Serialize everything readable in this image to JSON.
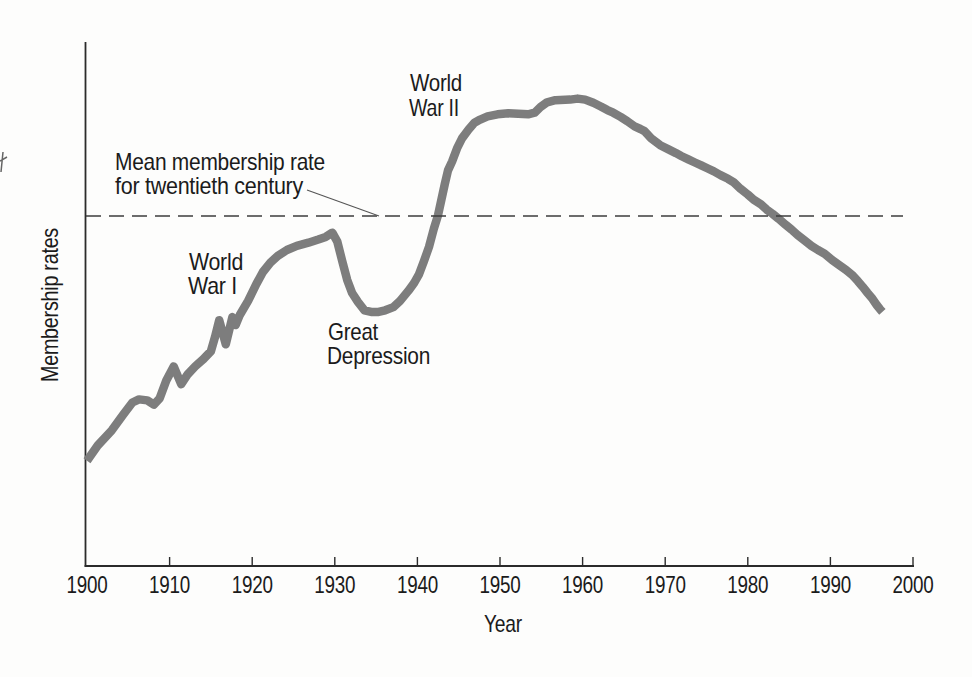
{
  "colors": {
    "background": "#fdfdfc",
    "ink": "#1b1b1b",
    "axis": "#2b2b2b",
    "curve": "#7d7d7d",
    "dashed_line": "#3d3d3d"
  },
  "chart_data": {
    "type": "line",
    "title": "",
    "xlabel": "Year",
    "ylabel": "Membership rates",
    "x_ticks": [
      1900,
      1910,
      1920,
      1930,
      1940,
      1950,
      1960,
      1970,
      1980,
      1990,
      2000
    ],
    "xlim": [
      1900,
      2000
    ],
    "ylim": [
      0,
      100
    ],
    "y_unit": "relative scale (no numeric y-axis labels shown)",
    "grid": false,
    "legend": false,
    "mean_line": {
      "style": "dashed",
      "value": 66.8,
      "label_line1": "Mean membership rate",
      "label_line2": "for twentieth century"
    },
    "annotations": {
      "world_war_1": {
        "line1": "World",
        "line2": "War I"
      },
      "world_war_2": {
        "line1": "World",
        "line2": "War II"
      },
      "great_depression": {
        "line1": "Great",
        "line2": "Depression"
      }
    },
    "series": [
      {
        "name": "Membership rates",
        "color": "#7d7d7d",
        "points": [
          [
            1900,
            20.1
          ],
          [
            1901.3,
            23
          ],
          [
            1903,
            25.9
          ],
          [
            1904.4,
            28.9
          ],
          [
            1905.5,
            31.2
          ],
          [
            1906.3,
            31.8
          ],
          [
            1907.3,
            31.6
          ],
          [
            1908.1,
            30.8
          ],
          [
            1908.8,
            32
          ],
          [
            1909.6,
            35.4
          ],
          [
            1910.5,
            38.1
          ],
          [
            1911,
            36.2
          ],
          [
            1911.4,
            34.7
          ],
          [
            1912.2,
            36.6
          ],
          [
            1913.1,
            38.1
          ],
          [
            1914.1,
            39.5
          ],
          [
            1915,
            41
          ],
          [
            1915.5,
            43.7
          ],
          [
            1916,
            46.9
          ],
          [
            1916.8,
            42.3
          ],
          [
            1917.6,
            47.5
          ],
          [
            1918,
            46
          ],
          [
            1918.5,
            47.9
          ],
          [
            1919.5,
            50.6
          ],
          [
            1920.5,
            53.8
          ],
          [
            1921.3,
            56.1
          ],
          [
            1922.2,
            57.9
          ],
          [
            1923.1,
            59.2
          ],
          [
            1924.2,
            60.3
          ],
          [
            1925.4,
            61.1
          ],
          [
            1926.8,
            61.7
          ],
          [
            1928,
            62.3
          ],
          [
            1928.9,
            62.8
          ],
          [
            1929.7,
            63.6
          ],
          [
            1930.3,
            61.9
          ],
          [
            1930.9,
            58.2
          ],
          [
            1931.5,
            54.6
          ],
          [
            1932.1,
            52.1
          ],
          [
            1932.8,
            50.4
          ],
          [
            1933.6,
            48.8
          ],
          [
            1934.4,
            48.5
          ],
          [
            1935.3,
            48.5
          ],
          [
            1936.1,
            48.8
          ],
          [
            1937.1,
            49.4
          ],
          [
            1937.9,
            50.6
          ],
          [
            1938.9,
            52.5
          ],
          [
            1939.6,
            54
          ],
          [
            1940.2,
            55.7
          ],
          [
            1940.8,
            58.2
          ],
          [
            1941.4,
            60.9
          ],
          [
            1942,
            64.4
          ],
          [
            1942.5,
            67
          ],
          [
            1943.3,
            72.8
          ],
          [
            1943.7,
            75.5
          ],
          [
            1944.2,
            77.2
          ],
          [
            1944.8,
            79.7
          ],
          [
            1945.4,
            81.6
          ],
          [
            1946.2,
            83.3
          ],
          [
            1946.9,
            84.6
          ],
          [
            1947.6,
            85.2
          ],
          [
            1948.5,
            85.8
          ],
          [
            1949.7,
            86.2
          ],
          [
            1951,
            86.4
          ],
          [
            1952.2,
            86.3
          ],
          [
            1953.4,
            86.2
          ],
          [
            1954.2,
            86.5
          ],
          [
            1954.9,
            87.6
          ],
          [
            1955.7,
            88.5
          ],
          [
            1956.7,
            88.9
          ],
          [
            1958.5,
            89
          ],
          [
            1959.4,
            89.2
          ],
          [
            1960.3,
            89
          ],
          [
            1961.3,
            88.4
          ],
          [
            1962.2,
            87.7
          ],
          [
            1963,
            87
          ],
          [
            1963.7,
            86.5
          ],
          [
            1964.6,
            85.7
          ],
          [
            1965.4,
            84.9
          ],
          [
            1966.3,
            83.9
          ],
          [
            1967,
            83.4
          ],
          [
            1967.5,
            83
          ],
          [
            1968.3,
            81.6
          ],
          [
            1969.4,
            80.3
          ],
          [
            1970.4,
            79.5
          ],
          [
            1971.3,
            78.8
          ],
          [
            1972,
            78.2
          ],
          [
            1972.8,
            77.6
          ],
          [
            1973.6,
            77
          ],
          [
            1974.3,
            76.5
          ],
          [
            1975.1,
            75.9
          ],
          [
            1975.9,
            75.3
          ],
          [
            1976.7,
            74.6
          ],
          [
            1977.6,
            73.9
          ],
          [
            1978.3,
            73.2
          ],
          [
            1979.1,
            72
          ],
          [
            1980,
            70.9
          ],
          [
            1980.7,
            69.9
          ],
          [
            1981.6,
            69
          ],
          [
            1982.3,
            68
          ],
          [
            1983,
            67.2
          ],
          [
            1983.7,
            66.3
          ],
          [
            1984.6,
            65.1
          ],
          [
            1985.3,
            64.2
          ],
          [
            1986,
            63.2
          ],
          [
            1986.9,
            62.1
          ],
          [
            1987.7,
            61.1
          ],
          [
            1988.5,
            60.3
          ],
          [
            1989.3,
            59.6
          ],
          [
            1990.2,
            58.4
          ],
          [
            1991,
            57.5
          ],
          [
            1991.9,
            56.5
          ],
          [
            1992.6,
            55.6
          ],
          [
            1993.3,
            54.4
          ],
          [
            1993.9,
            53.3
          ],
          [
            1994.5,
            52.1
          ],
          [
            1995.1,
            51
          ],
          [
            1995.6,
            49.8
          ],
          [
            1996,
            49
          ],
          [
            1996.3,
            48.5
          ]
        ]
      }
    ]
  }
}
